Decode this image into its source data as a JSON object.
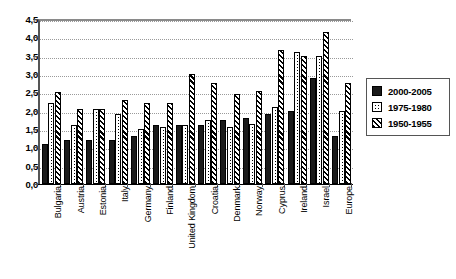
{
  "chart_data": {
    "type": "bar",
    "title": "",
    "subtitle": "",
    "xlabel": "",
    "ylabel": "",
    "ylim": [
      0.0,
      4.5
    ],
    "ytick_labels": [
      "0,0",
      "0,5",
      "1,0",
      "1,5",
      "2,0",
      "2,5",
      "3,0",
      "3,5",
      "4,0",
      "4,5"
    ],
    "ytick_values": [
      0.0,
      0.5,
      1.0,
      1.5,
      2.0,
      2.5,
      3.0,
      3.5,
      4.0,
      4.5
    ],
    "grid": "horizontal-dotted",
    "legend_position": "right",
    "categories": [
      "Bulgaria",
      "Austria",
      "Estonia",
      "Italy",
      "Germany",
      "Finland",
      "United Kingdom",
      "Croatia",
      "Denmark",
      "Norway",
      "Cyprus",
      "Ireland",
      "Israel",
      "Europe"
    ],
    "series": [
      {
        "name": "2000-2005",
        "color": "#1a1a1a",
        "pattern": "solid",
        "values": [
          1.1,
          1.2,
          1.2,
          1.2,
          1.3,
          1.6,
          1.6,
          1.6,
          1.75,
          1.8,
          1.9,
          2.0,
          2.9,
          1.3
        ]
      },
      {
        "name": "1975-1980",
        "color": "#ffffff",
        "pattern": "dotted",
        "values": [
          2.2,
          1.6,
          2.05,
          1.9,
          1.5,
          1.55,
          1.6,
          1.75,
          1.55,
          1.65,
          2.1,
          3.6,
          3.5,
          2.0
        ]
      },
      {
        "name": "1950-1955",
        "color": "#ffffff",
        "pattern": "diagonal-hatch",
        "values": [
          2.5,
          2.05,
          2.05,
          2.3,
          2.2,
          2.2,
          3.0,
          2.75,
          2.45,
          2.55,
          3.65,
          3.5,
          4.15,
          2.75
        ]
      }
    ]
  },
  "legend": {
    "items": [
      {
        "label": "2000-2005",
        "swatch": "solid-black-swatch"
      },
      {
        "label": "1975-1980",
        "swatch": "dotted-white-swatch"
      },
      {
        "label": "1950-1955",
        "swatch": "diagonal-hatch-swatch"
      }
    ]
  }
}
